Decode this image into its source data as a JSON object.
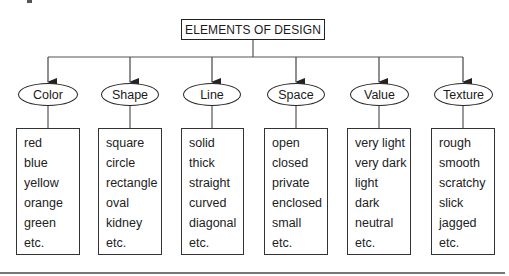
{
  "diagram": {
    "title": "ELEMENTS OF DESIGN",
    "categories": [
      {
        "label": "Color",
        "items": [
          "red",
          "blue",
          "yellow",
          "orange",
          "green",
          "etc."
        ]
      },
      {
        "label": "Shape",
        "items": [
          "square",
          "circle",
          "rectangle",
          "oval",
          "kidney",
          "etc."
        ]
      },
      {
        "label": "Line",
        "items": [
          "solid",
          "thick",
          "straight",
          "curved",
          "diagonal",
          "etc."
        ]
      },
      {
        "label": "Space",
        "items": [
          "open",
          "closed",
          "private",
          "enclosed",
          "small",
          "etc."
        ]
      },
      {
        "label": "Value",
        "items": [
          "very light",
          "very dark",
          "light",
          "dark",
          "neutral",
          "etc."
        ]
      },
      {
        "label": "Texture",
        "items": [
          "rough",
          "smooth",
          "scratchy",
          "slick",
          "jagged",
          "etc."
        ]
      }
    ],
    "colors": {
      "stroke": "#222222",
      "text": "#1a1a1a",
      "background": "#ffffff",
      "rule": "#777777"
    }
  }
}
